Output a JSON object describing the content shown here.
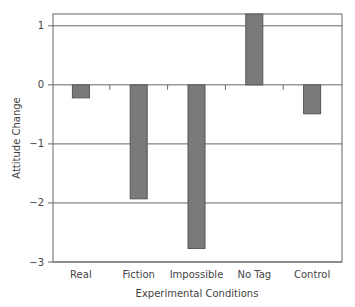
{
  "chart_data": {
    "type": "bar",
    "title": "",
    "xlabel": "Experimental Conditions",
    "ylabel": "Attitude Change",
    "categories": [
      "Real",
      "Fiction",
      "Impossible",
      "No Tag",
      "Control"
    ],
    "values": [
      -0.22,
      -1.93,
      -2.77,
      1.2,
      -0.49
    ],
    "ylim": [
      -3,
      1.2
    ],
    "yticks": [
      1,
      0,
      -1,
      -2,
      -3
    ],
    "ytick_labels": [
      "1",
      "0",
      "−1",
      "−2",
      "−3"
    ],
    "grid": "horizontal at integer ticks",
    "legend": "none",
    "bar_color": "#7a7a7a",
    "bar_edge_color": "#555555"
  },
  "axes": {
    "xlabel": "Experimental Conditions",
    "ylabel": "Attitude Change"
  }
}
